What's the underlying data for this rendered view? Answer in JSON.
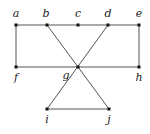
{
  "diagram": {
    "type": "graph",
    "nodes": [
      {
        "id": "a",
        "label": "a",
        "x": 16,
        "y": 25,
        "lx": 16,
        "ly": 17
      },
      {
        "id": "b",
        "label": "b",
        "x": 47,
        "y": 25,
        "lx": 46,
        "ly": 17
      },
      {
        "id": "c",
        "label": "c",
        "x": 78,
        "y": 25,
        "lx": 78,
        "ly": 17
      },
      {
        "id": "d",
        "label": "d",
        "x": 108,
        "y": 25,
        "lx": 108,
        "ly": 17
      },
      {
        "id": "e",
        "label": "e",
        "x": 139,
        "y": 25,
        "lx": 139,
        "ly": 17
      },
      {
        "id": "f",
        "label": "f",
        "x": 16,
        "y": 67,
        "lx": 16,
        "ly": 81
      },
      {
        "id": "g",
        "label": "g",
        "x": 78,
        "y": 67,
        "lx": 66,
        "ly": 79
      },
      {
        "id": "h",
        "label": "h",
        "x": 139,
        "y": 67,
        "lx": 139,
        "ly": 81
      },
      {
        "id": "i",
        "label": "i",
        "x": 47,
        "y": 109,
        "lx": 47,
        "ly": 123
      },
      {
        "id": "j",
        "label": "j",
        "x": 109,
        "y": 109,
        "lx": 109,
        "ly": 123
      }
    ],
    "edges": [
      [
        "a",
        "e"
      ],
      [
        "a",
        "f"
      ],
      [
        "e",
        "h"
      ],
      [
        "f",
        "h"
      ],
      [
        "b",
        "j"
      ],
      [
        "d",
        "i"
      ],
      [
        "i",
        "j"
      ]
    ]
  }
}
